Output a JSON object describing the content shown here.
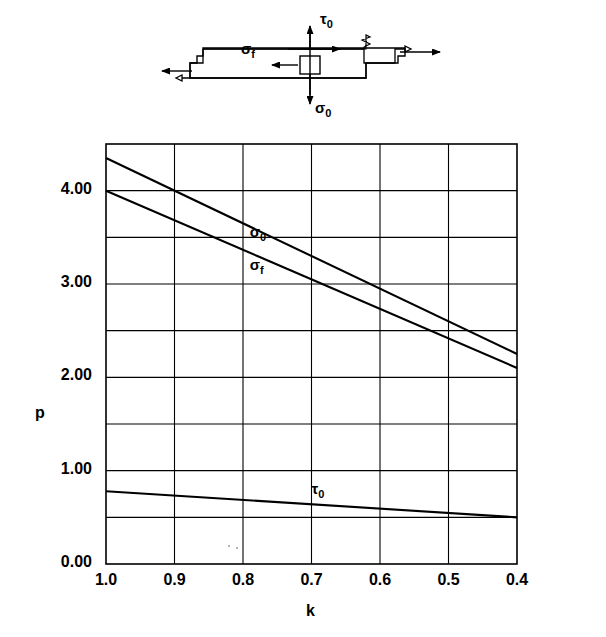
{
  "figure": {
    "schematic": {
      "name": "stress-element-schematic",
      "labels": [
        {
          "id": "tau0",
          "text": "τ",
          "sub": "0",
          "x": 318,
          "y": 17
        },
        {
          "id": "sigmaf",
          "text": "σ",
          "sub": "f",
          "x": 243,
          "y": 47
        },
        {
          "id": "sigma0",
          "text": "σ",
          "sub": "0",
          "x": 318,
          "y": 106
        }
      ]
    },
    "plot_area": {
      "left": 106,
      "top": 144,
      "right": 517,
      "bottom": 564
    }
  },
  "chart_data": {
    "type": "line",
    "title": "",
    "xlabel": "k",
    "ylabel": "p",
    "xlim": [
      1.0,
      0.4
    ],
    "ylim": [
      0.0,
      4.5
    ],
    "x_inverted": true,
    "xticks": [
      "1.0",
      "0.9",
      "0.8",
      "0.7",
      "0.6",
      "0.5",
      "0.4"
    ],
    "xtick_values": [
      1.0,
      0.9,
      0.8,
      0.7,
      0.6,
      0.5,
      0.4
    ],
    "yticks": [
      "0.00",
      "1.00",
      "2.00",
      "3.00",
      "4.00"
    ],
    "ytick_values": [
      0.0,
      1.0,
      2.0,
      3.0,
      4.0
    ],
    "grid": true,
    "grid_y_step": 0.5,
    "grid_x_step": 0.1,
    "legend": "inline-labels",
    "series": [
      {
        "name": "σ₀",
        "label_text": "σ",
        "label_sub": "0",
        "label_x": 0.79,
        "label_y": 3.55,
        "x": [
          1.0,
          0.4
        ],
        "values": [
          4.35,
          2.25
        ]
      },
      {
        "name": "σ_f",
        "label_text": "σ",
        "label_sub": "f",
        "label_x": 0.79,
        "label_y": 3.19,
        "x": [
          1.0,
          0.4
        ],
        "values": [
          4.0,
          2.1
        ]
      },
      {
        "name": "τ₀",
        "label_text": "τ",
        "label_sub": "0",
        "label_x": 0.7,
        "label_y": 0.79,
        "x": [
          1.0,
          0.4
        ],
        "values": [
          0.78,
          0.5
        ]
      }
    ]
  }
}
